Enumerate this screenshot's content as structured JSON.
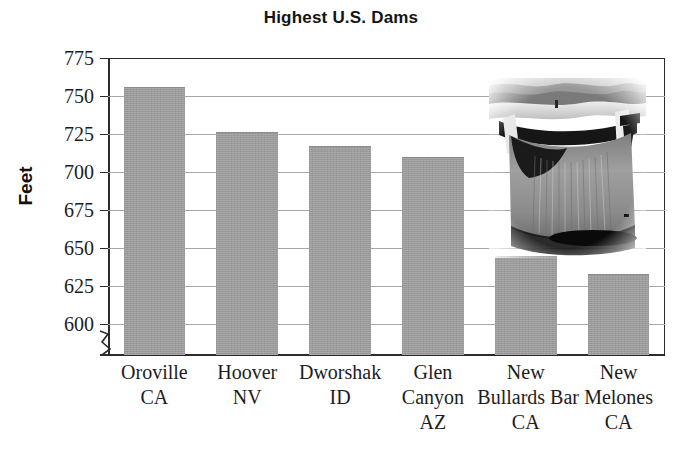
{
  "chart_data": {
    "type": "bar",
    "title": "Highest U.S. Dams",
    "xlabel": "",
    "ylabel": "Feet",
    "ylim": [
      600,
      775
    ],
    "ytick_values": [
      775,
      750,
      725,
      700,
      675,
      650,
      625,
      600
    ],
    "ytick_labels": [
      "775",
      "750",
      "725",
      "700",
      "675",
      "650",
      "625",
      "600"
    ],
    "axis_break": true,
    "grid": true,
    "legend": "none",
    "categories": [
      "Oroville\nCA",
      "Hoover\nNV",
      "Dworshak\nID",
      "Glen\nCanyon\nAZ",
      "New\nBullards Bar\nCA",
      "New\nMelones\nCA"
    ],
    "category_lines": [
      [
        "Oroville",
        "CA"
      ],
      [
        "Hoover",
        "NV"
      ],
      [
        "Dworshak",
        "ID"
      ],
      [
        "Glen",
        "Canyon",
        "AZ"
      ],
      [
        "New",
        "Bullards Bar",
        "CA"
      ],
      [
        "New",
        "Melones",
        "CA"
      ]
    ],
    "values": [
      756,
      726,
      717,
      710,
      645,
      633
    ],
    "bar_color": "#9b9b9b",
    "series": [
      {
        "name": "Height",
        "values": [
          756,
          726,
          717,
          710,
          645,
          633
        ]
      }
    ]
  },
  "chart": {
    "title": "Highest U.S. Dams",
    "y_axis_title": "Feet"
  },
  "inset": {
    "name": "dam-photograph",
    "caption": ""
  },
  "colors": {
    "bar": "#9b9b9b",
    "axis": "#2b2b2b",
    "gridline": "#a8a8a8",
    "background": "#ffffff",
    "text": "#1d1d1d"
  }
}
